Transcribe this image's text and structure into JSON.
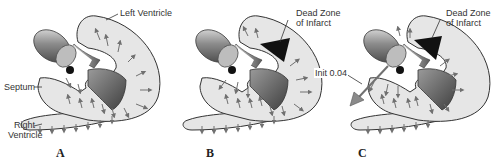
{
  "figure": {
    "panels": [
      {
        "id": "A",
        "letter": "A",
        "labels": {
          "left_ventricle": "Left Ventricle",
          "septum": "Septum",
          "right_ventricle_line1": "Right",
          "right_ventricle_line2": "Ventricle"
        }
      },
      {
        "id": "B",
        "letter": "B",
        "labels": {
          "dead_zone_line1": "Dead Zone",
          "dead_zone_line2": "of Infarct"
        }
      },
      {
        "id": "C",
        "letter": "C",
        "labels": {
          "dead_zone_line1": "Dead Zone",
          "dead_zone_line2": "of Infarct",
          "init_vector": "Init 0.04"
        }
      }
    ],
    "colors": {
      "tissue_fill": "#e6e6e6",
      "outline": "#333333",
      "arrow": "#707070",
      "infarct": "#111111",
      "cavity_shade": "#8a8a8a",
      "electrode": "#9a9a9a"
    }
  }
}
